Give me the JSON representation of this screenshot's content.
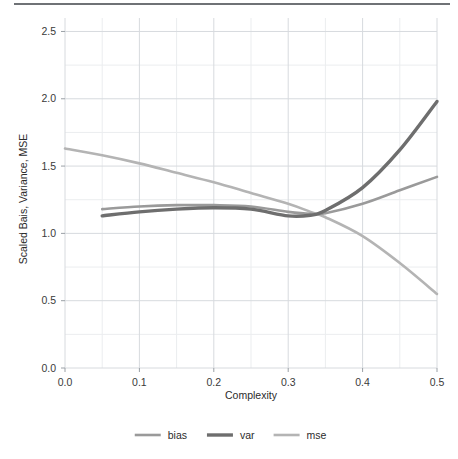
{
  "chart_data": {
    "type": "line",
    "title": "",
    "xlabel": "Complexity",
    "ylabel": "Scaled Bais, Variance, MSE",
    "xlim": [
      0.0,
      0.5
    ],
    "ylim": [
      0.0,
      2.6
    ],
    "grid": true,
    "legend_position": "bottom",
    "xticks": [
      0.0,
      0.1,
      0.2,
      0.3,
      0.4,
      0.5
    ],
    "xtick_labels": [
      "0.0",
      "0.1",
      "0.2",
      "0.3",
      "0.4",
      "0.5"
    ],
    "yticks": [
      0.0,
      0.5,
      1.0,
      1.5,
      2.0,
      2.5
    ],
    "ytick_labels": [
      "0.0",
      "0.5",
      "1.0",
      "1.5",
      "2.0",
      "2.5"
    ],
    "x_minor_step": 0.05,
    "y_minor_step": 0.25,
    "series": [
      {
        "name": "bias",
        "color": "#9a9a9a",
        "width": 2.6,
        "x": [
          0.05,
          0.1,
          0.15,
          0.2,
          0.25,
          0.3,
          0.33,
          0.35,
          0.4,
          0.45,
          0.5
        ],
        "values": [
          1.18,
          1.2,
          1.21,
          1.21,
          1.2,
          1.16,
          1.145,
          1.15,
          1.22,
          1.32,
          1.42
        ]
      },
      {
        "name": "var",
        "color": "#6e6e6e",
        "width": 3.4,
        "x": [
          0.05,
          0.1,
          0.15,
          0.2,
          0.25,
          0.3,
          0.33,
          0.35,
          0.4,
          0.45,
          0.5
        ],
        "values": [
          1.13,
          1.16,
          1.18,
          1.19,
          1.18,
          1.13,
          1.135,
          1.17,
          1.34,
          1.62,
          1.98
        ]
      },
      {
        "name": "mse",
        "color": "#b4b4b4",
        "width": 2.6,
        "x": [
          0.0,
          0.05,
          0.1,
          0.15,
          0.2,
          0.25,
          0.3,
          0.33,
          0.35,
          0.4,
          0.45,
          0.5
        ],
        "values": [
          1.63,
          1.58,
          1.52,
          1.45,
          1.38,
          1.3,
          1.22,
          1.16,
          1.12,
          0.98,
          0.78,
          0.55
        ]
      }
    ],
    "legend": [
      {
        "label": "bias",
        "color": "#9a9a9a",
        "width": 2.6
      },
      {
        "label": "var",
        "color": "#6e6e6e",
        "width": 3.4
      },
      {
        "label": "mse",
        "color": "#b4b4b4",
        "width": 2.6
      }
    ]
  },
  "figure": {
    "rule_color": "#6f7276",
    "background": "#ffffff"
  }
}
